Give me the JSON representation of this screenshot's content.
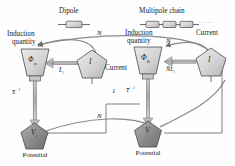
{
  "figure": {
    "type": "diagram",
    "background": "#fefefe"
  },
  "palette": {
    "node_light_fill": "#d6d6d6",
    "node_dark_fill": "#8f8f8f",
    "node_stroke": "#4a4a4a",
    "arrow_thick": "#8a8a8a",
    "arrow_thin": "#6f6f6f",
    "text": "#1a1a1a"
  },
  "headers": {
    "dipole": "Dipole",
    "multipole": "Multipole chain"
  },
  "left_group": {
    "induction_caption_line1": "Induction",
    "induction_caption_line2": "quantity",
    "induction_symbol": "Φ",
    "induction_subscript": "m",
    "current_symbol": "I",
    "current_caption": "Current",
    "potential_symbol": "V",
    "potential_subscript": "i",
    "potential_caption": "Potential",
    "arrow_current_to_flux": "L",
    "arrow_current_to_flux_sub": "i",
    "arrow_flux_to_potential": "− 1",
    "arrow_flux_to_potential_base": "S",
    "feedback_label": "N",
    "bottom_feedback_label": "N"
  },
  "right_group": {
    "induction_caption_line1": "Induction",
    "induction_caption_line2": "quantity",
    "induction_symbol": "Φ",
    "induction_subscript": "B",
    "current_symbol": "I",
    "current_caption": "Current",
    "potential_symbol": "V",
    "potential_caption": "Potential",
    "arrow_current_to_flux_prefix": "N",
    "arrow_current_to_flux": "L",
    "arrow_current_to_flux_sub": "i",
    "arrow_flux_to_potential": "− 1",
    "arrow_flux_to_potential_base": "T",
    "feedback_label": "N",
    "left_link_label": "1"
  },
  "chain": {
    "segment_count": 3,
    "ellipsis": "·····"
  }
}
